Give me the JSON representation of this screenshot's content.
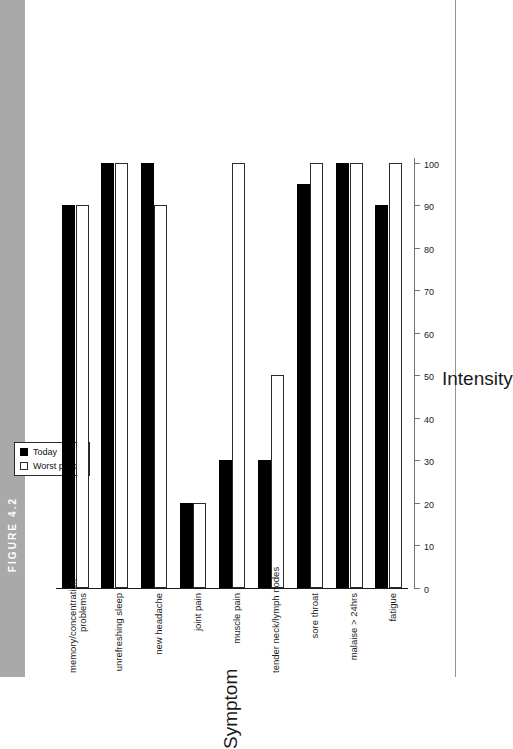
{
  "figure": {
    "tab_label": "FIGURE 4.2",
    "tab_color": "#a9a9a9"
  },
  "legend": {
    "series": [
      {
        "label": "Today",
        "swatch": "filled-square",
        "color": "#000000"
      },
      {
        "label": "Worst period",
        "swatch": "hollow-square",
        "color": "#ffffff"
      }
    ]
  },
  "axes": {
    "value_axis_title": "Intensity",
    "category_axis_title": "Symptom",
    "ticks": [
      "0",
      "10",
      "20",
      "30",
      "40",
      "50",
      "60",
      "70",
      "80",
      "90",
      "100"
    ]
  },
  "chart_data": {
    "type": "bar",
    "title": "",
    "xlabel": "Symptom",
    "ylabel": "Intensity",
    "ylim": [
      0,
      100
    ],
    "grid": false,
    "orientation": "vertical-rotated",
    "legend_position": "top-left",
    "categories": [
      "memory/concentration problems",
      "unrefreshing sleep",
      "new headache",
      "joint pain",
      "muscle pain",
      "tender neck/lymph nodes",
      "sore throat",
      "malaise > 24hrs",
      "fatigue"
    ],
    "series": [
      {
        "name": "Today",
        "values": [
          90,
          100,
          100,
          20,
          30,
          30,
          95,
          100,
          90
        ]
      },
      {
        "name": "Worst period",
        "values": [
          90,
          100,
          90,
          20,
          100,
          50,
          100,
          100,
          100
        ]
      }
    ]
  }
}
